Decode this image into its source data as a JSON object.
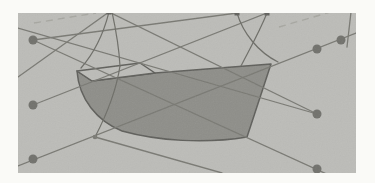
{
  "figure": {
    "kind": "scanned-wireframe-illustration",
    "canvas": {
      "width": 375,
      "height": 183
    },
    "panel": {
      "x": 18,
      "y": 13,
      "width": 338,
      "height": 160
    },
    "colors": {
      "page": "#fafaf7",
      "panel": "#bcbcb8",
      "hull_fill": "#8e8e89",
      "hull_stroke": "#5f5f5b",
      "deck_fill": "#bcbcb8",
      "net_line": "#797973",
      "frame_curve": "#6d6d67",
      "control_point": "#71716c",
      "end_point": "#62625e",
      "junction_point": "#7a7a74",
      "dashed_line": "#a7a7a1"
    },
    "hull_surface": {
      "path": "M77,71 L92,81 L155,73 L271,64 L247,137 C205,144 158,141 122,131 C97,121 79,99 77,71 Z"
    },
    "deck_outline": {
      "path": "M77,71 L140,63 L155,73 L92,81 Z"
    },
    "control_points": [
      {
        "id": "left-top",
        "x": 33,
        "y": 40,
        "r": 4.5
      },
      {
        "id": "left-middle",
        "x": 33,
        "y": 105,
        "r": 4.5
      },
      {
        "id": "left-bottom",
        "x": 33,
        "y": 159,
        "r": 4.5
      },
      {
        "id": "right-upper-outer",
        "x": 341,
        "y": 40,
        "r": 4.5
      },
      {
        "id": "right-upper-inner",
        "x": 317,
        "y": 49,
        "r": 4.5
      },
      {
        "id": "right-middle",
        "x": 317,
        "y": 114,
        "r": 4.5
      },
      {
        "id": "right-bottom",
        "x": 317,
        "y": 169,
        "r": 4.5
      }
    ],
    "junction_points": [
      {
        "id": "keel-junction",
        "x": 95,
        "y": 137,
        "r": 2.3
      }
    ],
    "end_points": [
      {
        "id": "top-bow",
        "x": 109,
        "y": 12,
        "size": 5
      },
      {
        "id": "top-stern-left",
        "x": 237,
        "y": 13,
        "size": 5
      },
      {
        "id": "top-stern-right",
        "x": 267,
        "y": 13,
        "size": 5
      }
    ],
    "net_lines": [
      {
        "id": "diag-bottomleft-topright",
        "x1": 18,
        "y1": 166,
        "x2": 356,
        "y2": 33
      },
      {
        "id": "leftmid-to-topstern",
        "x1": 33,
        "y1": 105,
        "x2": 267,
        "y2": 13
      },
      {
        "id": "topleft-to-rightmid",
        "x1": 18,
        "y1": 28,
        "x2": 317,
        "y2": 114
      },
      {
        "id": "lefttop-to-topstern",
        "x1": 33,
        "y1": 40,
        "x2": 237,
        "y2": 13
      },
      {
        "id": "topbow-to-rightmid",
        "x1": 109,
        "y1": 12,
        "x2": 317,
        "y2": 114
      },
      {
        "id": "lefttop-to-rightbottom",
        "x1": 33,
        "y1": 40,
        "x2": 331,
        "y2": 176
      },
      {
        "id": "junction-to-bottomedge",
        "x1": 95,
        "y1": 137,
        "x2": 222,
        "y2": 173
      },
      {
        "id": "topbow-to-leftedge",
        "x1": 109,
        "y1": 12,
        "x2": 18,
        "y2": 77
      },
      {
        "id": "right-vertical-tick",
        "x1": 351,
        "y1": 12,
        "x2": 347,
        "y2": 47
      }
    ],
    "frame_curves": [
      {
        "id": "bow-profile",
        "path": "M109,12 C104,32 95,52 81,68"
      },
      {
        "id": "bow-station-upper",
        "path": "M112,12 C116,30 119,48 120,66"
      },
      {
        "id": "bow-station-lower",
        "path": "M120,66 C116,92 106,116 95,137"
      },
      {
        "id": "stern-station-left",
        "path": "M237,13 C243,33 258,52 278,62"
      },
      {
        "id": "stern-station-right",
        "path": "M267,13 C259,33 248,52 241,66"
      }
    ],
    "dashed_lines": [
      {
        "id": "dash-top-left",
        "x1": 34,
        "y1": 23,
        "x2": 96,
        "y2": 13
      },
      {
        "id": "dash-top-right",
        "x1": 279,
        "y1": 27,
        "x2": 341,
        "y2": 9
      }
    ]
  }
}
